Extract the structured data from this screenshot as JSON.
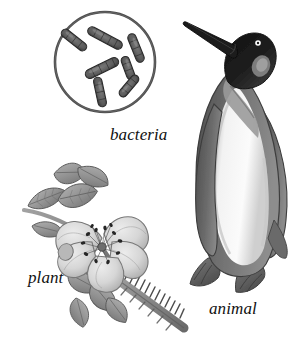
{
  "figure": {
    "width": 308,
    "height": 341,
    "background_color": "#ffffff",
    "style": "grayscale pencil / engraving illustration",
    "ink_color": "#3a3a3a"
  },
  "captions": {
    "bacteria": "bacteria",
    "plant": "plant",
    "animal": "animal"
  },
  "items": [
    {
      "id": "bacteria",
      "label": "bacteria",
      "subject": "rod-shaped bacteria (bacilli) in a circular microscope field",
      "icon": "petri-dish-icon",
      "cell_count": 7,
      "colors": {
        "ring": "#4a4a4a",
        "cell_fill": "#5a5a5a",
        "cell_outline": "#2e2e2e",
        "field": "#ffffff"
      }
    },
    {
      "id": "plant",
      "label": "plant",
      "subject": "wild rose blossom with compound leaves and a thorny stem",
      "icon": "rose-flower-icon",
      "petal_count": 5,
      "colors": {
        "petal": "#d9d9d9",
        "petal_shade": "#b4b4b4",
        "leaf": "#9a9a9a",
        "leaf_dark": "#6f6f6f",
        "stem": "#808080",
        "stamen": "#2f2f2f"
      }
    },
    {
      "id": "animal",
      "label": "animal",
      "subject": "king penguin standing upright, head tilted upward",
      "icon": "penguin-icon",
      "colors": {
        "head": "#1e1e1e",
        "back": "#6a6a6a",
        "back_dark": "#4a4a4a",
        "belly": "#f4f4f4",
        "belly_shade": "#d2d2d2",
        "ear_patch": "#8e8e8e",
        "feet": "#5e5e5e",
        "eye": "#ffffff"
      }
    }
  ]
}
